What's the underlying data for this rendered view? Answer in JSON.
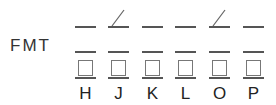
{
  "label": "FMT",
  "columns": [
    {
      "letter": "H",
      "slash": false
    },
    {
      "letter": "J",
      "slash": true
    },
    {
      "letter": "K",
      "slash": false
    },
    {
      "letter": "L",
      "slash": false
    },
    {
      "letter": "O",
      "slash": true
    },
    {
      "letter": "P",
      "slash": false
    }
  ]
}
